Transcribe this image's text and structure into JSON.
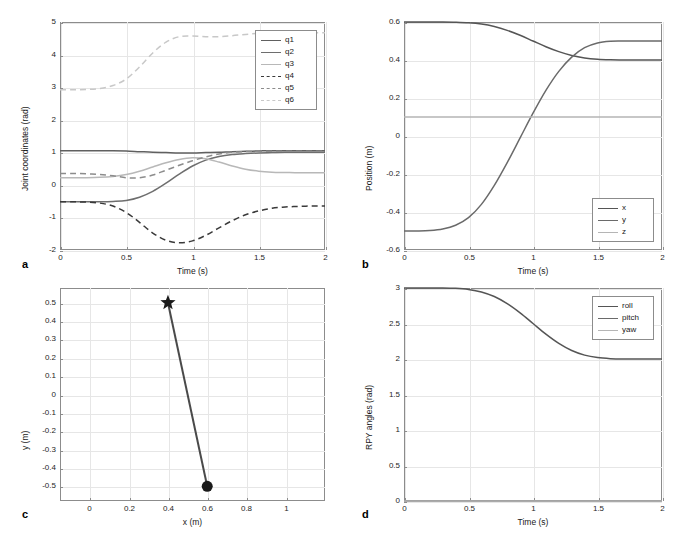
{
  "figure": {
    "panels": [
      "a",
      "b",
      "c",
      "d"
    ]
  },
  "chart_data": [
    {
      "id": "a",
      "type": "line",
      "panel_letter": "a",
      "title": "",
      "xlabel": "Time (s)",
      "ylabel": "Joint coordinates (rad)",
      "xlim": [
        0,
        2
      ],
      "ylim": [
        -2,
        5
      ],
      "xticks": [
        0,
        0.5,
        1,
        1.5,
        2
      ],
      "xticklabels": [
        "0",
        "0.5",
        "1",
        "1.5",
        "2"
      ],
      "yticks": [
        -2,
        -1,
        0,
        1,
        2,
        3,
        4,
        5
      ],
      "yticklabels": [
        "-2",
        "-1",
        "0",
        "1",
        "2",
        "3",
        "4",
        "5"
      ],
      "grid": true,
      "legend_position": "upper right",
      "legend": [
        "q1",
        "q2",
        "q3",
        "q4",
        "q5",
        "q6"
      ],
      "x": [
        0,
        0.1,
        0.2,
        0.3,
        0.4,
        0.5,
        0.6,
        0.7,
        0.8,
        0.9,
        1.0,
        1.1,
        1.2,
        1.3,
        1.4,
        1.5,
        1.6,
        1.7,
        1.8,
        1.9,
        2.0
      ],
      "series": [
        {
          "name": "q1",
          "style": "solid",
          "color": "#606060",
          "values": [
            1.05,
            1.05,
            1.05,
            1.05,
            1.05,
            1.04,
            1.02,
            1.0,
            0.99,
            0.98,
            0.98,
            0.99,
            1.0,
            1.02,
            1.03,
            1.04,
            1.05,
            1.05,
            1.05,
            1.05,
            1.05
          ]
        },
        {
          "name": "q2",
          "style": "solid",
          "color": "#6e6e6e",
          "values": [
            -0.52,
            -0.52,
            -0.52,
            -0.52,
            -0.51,
            -0.48,
            -0.38,
            -0.2,
            0.05,
            0.33,
            0.58,
            0.76,
            0.87,
            0.93,
            0.96,
            0.98,
            0.99,
            1.0,
            1.0,
            1.0,
            1.0
          ]
        },
        {
          "name": "q3",
          "style": "solid",
          "color": "#b8b8b8",
          "values": [
            0.22,
            0.22,
            0.22,
            0.23,
            0.26,
            0.32,
            0.42,
            0.55,
            0.68,
            0.78,
            0.83,
            0.8,
            0.7,
            0.58,
            0.48,
            0.42,
            0.39,
            0.38,
            0.37,
            0.37,
            0.37
          ]
        },
        {
          "name": "q4",
          "style": "dashed",
          "color": "#3a3a3a",
          "values": [
            -0.52,
            -0.52,
            -0.53,
            -0.56,
            -0.65,
            -0.85,
            -1.15,
            -1.48,
            -1.7,
            -1.78,
            -1.72,
            -1.55,
            -1.32,
            -1.1,
            -0.92,
            -0.8,
            -0.72,
            -0.68,
            -0.66,
            -0.65,
            -0.65
          ]
        },
        {
          "name": "q5",
          "style": "dashed",
          "color": "#8c8c8c",
          "values": [
            0.35,
            0.35,
            0.34,
            0.32,
            0.28,
            0.22,
            0.22,
            0.3,
            0.45,
            0.6,
            0.74,
            0.86,
            0.95,
            1.0,
            1.02,
            1.03,
            1.03,
            1.03,
            1.03,
            1.03,
            1.03
          ]
        },
        {
          "name": "q6",
          "style": "dashed",
          "color": "#c8c8c8",
          "values": [
            2.92,
            2.92,
            2.93,
            2.96,
            3.05,
            3.25,
            3.62,
            4.05,
            4.38,
            4.55,
            4.57,
            4.55,
            4.55,
            4.58,
            4.62,
            4.65,
            4.66,
            4.67,
            4.67,
            4.67,
            4.67
          ]
        }
      ]
    },
    {
      "id": "b",
      "type": "line",
      "panel_letter": "b",
      "title": "",
      "xlabel": "Time (s)",
      "ylabel": "Position (m)",
      "xlim": [
        0,
        2
      ],
      "ylim": [
        -0.6,
        0.6
      ],
      "xticks": [
        0,
        0.5,
        1,
        1.5,
        2
      ],
      "xticklabels": [
        "0",
        "0.5",
        "1",
        "1.5",
        "2"
      ],
      "yticks": [
        -0.6,
        -0.4,
        -0.2,
        0,
        0.2,
        0.4,
        0.6
      ],
      "yticklabels": [
        "-0.6",
        "-0.4",
        "-0.2",
        "0",
        "0.2",
        "0.4",
        "0.6"
      ],
      "grid": true,
      "legend_position": "lower right",
      "legend": [
        "x",
        "y",
        "z"
      ],
      "x": [
        0,
        0.1,
        0.2,
        0.3,
        0.4,
        0.5,
        0.6,
        0.7,
        0.8,
        0.9,
        1.0,
        1.1,
        1.2,
        1.3,
        1.4,
        1.5,
        1.6,
        1.7,
        1.8,
        1.9,
        2.0
      ],
      "series": [
        {
          "name": "x",
          "style": "solid",
          "color": "#555555",
          "values": [
            0.6,
            0.6,
            0.6,
            0.6,
            0.599,
            0.596,
            0.589,
            0.576,
            0.556,
            0.53,
            0.5,
            0.47,
            0.444,
            0.424,
            0.411,
            0.404,
            0.401,
            0.4,
            0.4,
            0.4,
            0.4
          ]
        },
        {
          "name": "y",
          "style": "solid",
          "color": "#6a6a6a",
          "values": [
            -0.5,
            -0.5,
            -0.498,
            -0.49,
            -0.47,
            -0.43,
            -0.36,
            -0.26,
            -0.14,
            -0.01,
            0.12,
            0.24,
            0.34,
            0.415,
            0.465,
            0.49,
            0.499,
            0.5,
            0.5,
            0.5,
            0.5
          ]
        },
        {
          "name": "z",
          "style": "solid",
          "color": "#b5b5b5",
          "values": [
            0.1,
            0.1,
            0.1,
            0.1,
            0.1,
            0.1,
            0.1,
            0.1,
            0.1,
            0.1,
            0.1,
            0.1,
            0.1,
            0.1,
            0.1,
            0.1,
            0.1,
            0.1,
            0.1,
            0.1,
            0.1
          ]
        }
      ]
    },
    {
      "id": "c",
      "type": "line",
      "panel_letter": "c",
      "title": "",
      "xlabel": "x (m)",
      "ylabel": "y (m)",
      "xlim": [
        -0.15,
        1.2
      ],
      "ylim": [
        -0.58,
        0.58
      ],
      "xticks": [
        0,
        0.2,
        0.4,
        0.6,
        0.8,
        1
      ],
      "xticklabels": [
        "0",
        "0.2",
        "0.4",
        "0.6",
        "0.8",
        "1"
      ],
      "yticks": [
        -0.5,
        -0.4,
        -0.3,
        -0.2,
        -0.1,
        0,
        0.1,
        0.2,
        0.3,
        0.4,
        0.5
      ],
      "yticklabels": [
        "-0.5",
        "-0.4",
        "-0.3",
        "-0.2",
        "-0.1",
        "0",
        "0.1",
        "0.2",
        "0.3",
        "0.4",
        "0.5"
      ],
      "grid": true,
      "legend_position": "none",
      "legend": [],
      "series": [
        {
          "name": "path",
          "style": "solid",
          "color": "#4a4a4a",
          "points": [
            [
              0.6,
              -0.5
            ],
            [
              0.4,
              0.5
            ]
          ]
        }
      ],
      "markers": [
        {
          "name": "start-marker",
          "shape": "circle",
          "x": 0.6,
          "y": -0.5,
          "color": "#1a1a1a"
        },
        {
          "name": "goal-marker",
          "shape": "star",
          "x": 0.4,
          "y": 0.5,
          "color": "#1a1a1a"
        }
      ]
    },
    {
      "id": "d",
      "type": "line",
      "panel_letter": "d",
      "title": "",
      "xlabel": "Time (s)",
      "ylabel": "RPY angles (rad)",
      "xlim": [
        0,
        2
      ],
      "ylim": [
        0,
        3
      ],
      "xticks": [
        0,
        0.5,
        1,
        1.5,
        2
      ],
      "xticklabels": [
        "0",
        "0.5",
        "1",
        "1.5",
        "2"
      ],
      "yticks": [
        0,
        0.5,
        1,
        1.5,
        2,
        2.5,
        3
      ],
      "yticklabels": [
        "0",
        "0.5",
        "1",
        "1.5",
        "2",
        "2.5",
        "3"
      ],
      "grid": true,
      "legend_position": "upper right",
      "legend": [
        "roll",
        "pitch",
        "yaw"
      ],
      "x": [
        0,
        0.1,
        0.2,
        0.3,
        0.4,
        0.5,
        0.6,
        0.7,
        0.8,
        0.9,
        1.0,
        1.1,
        1.2,
        1.3,
        1.4,
        1.5,
        1.6,
        1.7,
        1.8,
        1.9,
        2.0
      ],
      "series": [
        {
          "name": "roll",
          "style": "solid",
          "color": "#555555",
          "values": [
            3.0,
            3.0,
            3.0,
            3.0,
            2.995,
            2.98,
            2.945,
            2.88,
            2.78,
            2.65,
            2.5,
            2.35,
            2.22,
            2.12,
            2.055,
            2.02,
            2.005,
            2.0,
            2.0,
            2.0,
            2.0
          ]
        },
        {
          "name": "pitch",
          "style": "solid",
          "color": "#6a6a6a",
          "values": [
            0,
            0,
            0,
            0,
            0,
            0,
            0,
            0,
            0,
            0,
            0,
            0,
            0,
            0,
            0,
            0,
            0,
            0,
            0,
            0,
            0
          ]
        },
        {
          "name": "yaw",
          "style": "solid",
          "color": "#b5b5b5",
          "values": [
            0,
            0,
            0,
            0,
            0,
            0,
            0,
            0,
            0,
            0,
            0,
            0,
            0,
            0,
            0,
            0,
            0,
            0,
            0,
            0,
            0
          ]
        }
      ]
    }
  ]
}
